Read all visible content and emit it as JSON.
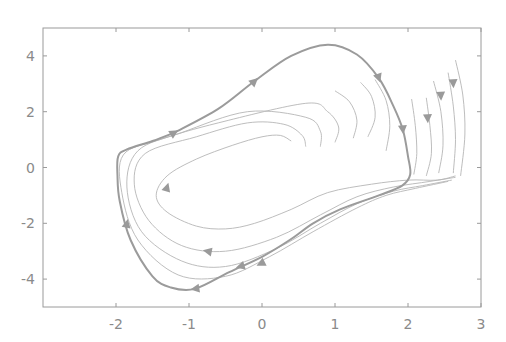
{
  "chart_data": {
    "type": "line",
    "title": "",
    "subtitle": "",
    "xlabel": "",
    "ylabel": "",
    "xlim": [
      -3,
      3
    ],
    "ylim": [
      -5,
      5
    ],
    "grid": false,
    "legend": null,
    "x_ticks": [
      -2,
      -1,
      0,
      1,
      2,
      3
    ],
    "y_ticks": [
      -4,
      -2,
      0,
      2,
      4
    ],
    "x_tick_labels": [
      "-2",
      "-1",
      "0",
      "1",
      "2",
      "3"
    ],
    "y_tick_labels": [
      "-4",
      "-2",
      "0",
      "2",
      "4"
    ],
    "limit_cycle": {
      "name": "limit-cycle",
      "points": [
        [
          -1.2,
          1.25
        ],
        [
          -0.6,
          2.1
        ],
        [
          -0.1,
          3.1
        ],
        [
          0.4,
          4.0
        ],
        [
          0.9,
          4.4
        ],
        [
          1.3,
          4.05
        ],
        [
          1.6,
          3.2
        ],
        [
          1.8,
          2.2
        ],
        [
          1.93,
          1.35
        ],
        [
          2.0,
          0.4
        ],
        [
          2.03,
          -0.25
        ],
        [
          1.92,
          -0.65
        ],
        [
          1.6,
          -1.0
        ],
        [
          1.07,
          -1.5
        ],
        [
          0.7,
          -2.0
        ],
        [
          0.38,
          -2.6
        ],
        [
          0.0,
          -3.2
        ],
        [
          -0.45,
          -3.75
        ],
        [
          -0.92,
          -4.35
        ],
        [
          -1.25,
          -4.3
        ],
        [
          -1.5,
          -3.9
        ],
        [
          -1.8,
          -2.6
        ],
        [
          -1.95,
          -1.2
        ],
        [
          -1.98,
          -0.3
        ],
        [
          -1.97,
          0.4
        ],
        [
          -1.85,
          0.65
        ],
        [
          -1.5,
          0.95
        ],
        [
          -1.2,
          1.25
        ]
      ],
      "arrows": [
        {
          "at": [
            -1.2,
            1.25
          ],
          "dir": [
            1,
            0.6
          ]
        },
        [
          -0.1,
          3.1
        ],
        {
          "at": [
            1.6,
            3.2
          ],
          "dir": [
            0.35,
            -1
          ]
        },
        {
          "at": [
            1.93,
            1.35
          ],
          "dir": [
            0.1,
            -1
          ]
        },
        {
          "at": [
            -0.92,
            -4.35
          ],
          "dir": [
            -1,
            -0.15
          ]
        },
        {
          "at": [
            -1.85,
            -2.0
          ],
          "dir": [
            0.2,
            1
          ]
        }
      ]
    },
    "series": [
      {
        "name": "inner-1",
        "points": [
          [
            0.4,
            0.95
          ],
          [
            0.25,
            1.15
          ],
          [
            0.0,
            1.1
          ],
          [
            -0.4,
            0.8
          ],
          [
            -0.9,
            0.3
          ],
          [
            -1.3,
            -0.3
          ],
          [
            -1.45,
            -1.0
          ],
          [
            -1.3,
            -1.6
          ],
          [
            -0.9,
            -2.1
          ],
          [
            -0.5,
            -2.2
          ],
          [
            -0.1,
            -2.0
          ],
          [
            0.4,
            -1.5
          ],
          [
            0.9,
            -0.9
          ],
          [
            1.5,
            -0.6
          ],
          [
            2.0,
            -0.45
          ],
          [
            2.4,
            -0.45
          ],
          [
            2.65,
            -0.3
          ]
        ]
      },
      {
        "name": "inner-2",
        "points": [
          [
            0.6,
            0.75
          ],
          [
            0.55,
            1.15
          ],
          [
            0.3,
            1.55
          ],
          [
            -0.2,
            1.6
          ],
          [
            -0.9,
            1.1
          ],
          [
            -1.6,
            0.5
          ],
          [
            -1.75,
            -0.6
          ],
          [
            -1.55,
            -1.9
          ],
          [
            -1.1,
            -2.8
          ],
          [
            -0.5,
            -3.0
          ],
          [
            0.2,
            -2.5
          ],
          [
            0.8,
            -1.7
          ],
          [
            1.3,
            -1.05
          ],
          [
            1.8,
            -0.7
          ],
          [
            2.3,
            -0.5
          ],
          [
            2.65,
            -0.35
          ]
        ]
      },
      {
        "name": "inner-3",
        "points": [
          [
            0.8,
            0.75
          ],
          [
            0.8,
            1.3
          ],
          [
            0.6,
            1.8
          ],
          [
            -0.2,
            2.0
          ],
          [
            -1.1,
            1.25
          ],
          [
            -1.7,
            0.6
          ],
          [
            -1.85,
            -0.7
          ],
          [
            -1.65,
            -2.3
          ],
          [
            -1.1,
            -3.35
          ],
          [
            -0.5,
            -3.55
          ],
          [
            0.2,
            -2.9
          ],
          [
            0.8,
            -2.0
          ],
          [
            1.3,
            -1.3
          ],
          [
            1.8,
            -0.85
          ],
          [
            2.2,
            -0.65
          ],
          [
            2.6,
            -0.45
          ]
        ]
      },
      {
        "name": "inner-4",
        "points": [
          [
            1.0,
            0.9
          ],
          [
            1.05,
            1.45
          ],
          [
            0.9,
            2.0
          ],
          [
            0.6,
            2.3
          ],
          [
            -0.6,
            1.6
          ],
          [
            -1.4,
            1.0
          ],
          [
            -1.9,
            0.45
          ],
          [
            -1.92,
            -0.9
          ],
          [
            -1.7,
            -2.6
          ],
          [
            -1.15,
            -3.85
          ],
          [
            -0.5,
            -3.9
          ],
          [
            0.1,
            -3.2
          ],
          [
            0.7,
            -2.3
          ],
          [
            1.3,
            -1.45
          ],
          [
            1.7,
            -1.0
          ],
          [
            2.1,
            -0.75
          ],
          [
            2.55,
            -0.5
          ]
        ]
      },
      {
        "name": "inner-5",
        "points": [
          [
            1.25,
            1.05
          ],
          [
            1.3,
            1.7
          ],
          [
            1.2,
            2.35
          ],
          [
            1.0,
            2.75
          ]
        ]
      },
      {
        "name": "inner-6",
        "points": [
          [
            1.45,
            1.1
          ],
          [
            1.55,
            1.8
          ],
          [
            1.5,
            2.55
          ],
          [
            1.35,
            3.05
          ]
        ]
      },
      {
        "name": "inner-7",
        "points": [
          [
            1.7,
            0.6
          ],
          [
            1.75,
            1.5
          ],
          [
            1.7,
            2.4
          ],
          [
            1.55,
            3.15
          ]
        ]
      },
      {
        "name": "outer-1",
        "points": [
          [
            2.05,
            2.45
          ],
          [
            2.1,
            1.5
          ],
          [
            2.12,
            0.5
          ],
          [
            2.08,
            -0.25
          ]
        ]
      },
      {
        "name": "outer-2",
        "points": [
          [
            2.25,
            2.5
          ],
          [
            2.3,
            1.5
          ],
          [
            2.32,
            0.5
          ],
          [
            2.25,
            -0.3
          ]
        ]
      },
      {
        "name": "outer-3",
        "points": [
          [
            2.35,
            3.1
          ],
          [
            2.45,
            2.0
          ],
          [
            2.48,
            0.8
          ],
          [
            2.42,
            -0.2
          ]
        ]
      },
      {
        "name": "outer-4",
        "points": [
          [
            2.55,
            3.4
          ],
          [
            2.62,
            2.2
          ],
          [
            2.65,
            1.0
          ],
          [
            2.62,
            -0.2
          ]
        ]
      },
      {
        "name": "outer-5",
        "points": [
          [
            2.65,
            3.85
          ],
          [
            2.75,
            2.6
          ],
          [
            2.78,
            1.2
          ],
          [
            2.72,
            -0.3
          ]
        ]
      }
    ],
    "extra_arrows": [
      {
        "at": [
          -1.3,
          -0.7
        ],
        "dir": [
          0.3,
          1
        ]
      },
      {
        "at": [
          -0.75,
          -3.0
        ],
        "dir": [
          -1,
          0.2
        ]
      },
      {
        "at": [
          -0.3,
          -3.55
        ],
        "dir": [
          -1,
          -0.3
        ]
      },
      {
        "at": [
          -0.02,
          -3.45
        ],
        "dir": [
          -1,
          -0.5
        ]
      },
      {
        "at": [
          2.27,
          1.75
        ],
        "dir": [
          0.05,
          -1
        ]
      },
      {
        "at": [
          2.45,
          2.55
        ],
        "dir": [
          0.05,
          -1
        ]
      },
      {
        "at": [
          2.62,
          3.0
        ],
        "dir": [
          0.05,
          -1
        ]
      }
    ]
  }
}
